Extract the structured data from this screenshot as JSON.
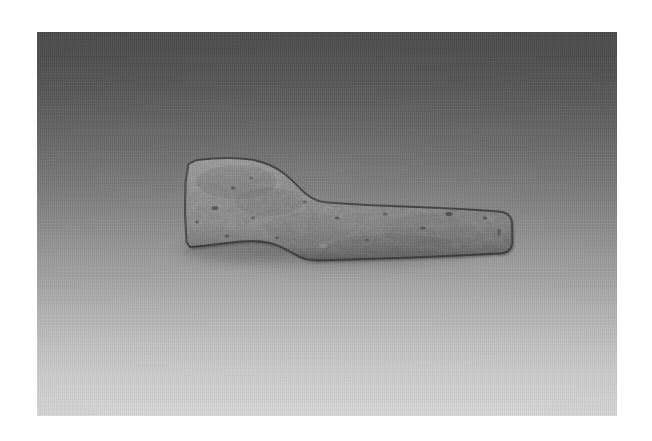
{
  "media": {
    "kind": "photograph",
    "subject": "stone-axe-head",
    "orientation": "landscape",
    "frame": {
      "canvas_width": 652,
      "canvas_height": 441,
      "border_color": "#ffffff",
      "photo_left": 37,
      "photo_top": 32,
      "photo_width": 580,
      "photo_height": 384
    },
    "backdrop": {
      "type": "vertical-gradient",
      "top_color": "#4b4b4b",
      "mid_color": "#8d8d8d",
      "bottom_color": "#d7d7d7",
      "texture": "fine-woven-paper"
    },
    "object": {
      "label": "ground-stone-axe-head",
      "description": "Flaked and ground stone implement with a broad flared bit at the left tapering through a curved shoulder into a narrow straight haft that ends in a blunt rounded poll at the right.",
      "body_color": "#7b7b7b",
      "highlight_color": "#949494",
      "shade_color": "#5f5f5f",
      "outline_color": "#2e2e2e",
      "shadow_color": "#555555",
      "bounds": {
        "left": 185,
        "top": 159,
        "right": 512,
        "bottom": 295
      }
    }
  }
}
